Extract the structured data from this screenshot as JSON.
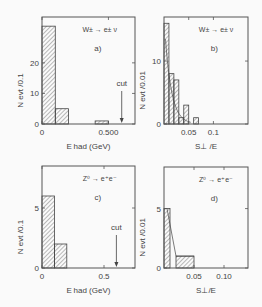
{
  "chart_data": [
    {
      "panel": "a",
      "type": "bar",
      "title": "W± → e± ν",
      "panel_label": "a)",
      "xlabel": "E_had (GeV)",
      "ylabel": "N_evt /0.1",
      "xlim": [
        0,
        0.7
      ],
      "ylim": [
        0,
        35
      ],
      "xticks": [
        "0",
        "0.500"
      ],
      "yticks": [
        "0",
        "10",
        "20"
      ],
      "bins": [
        [
          0.0,
          0.1
        ],
        [
          0.1,
          0.2
        ],
        [
          0.4,
          0.5
        ]
      ],
      "values": [
        32,
        5,
        1
      ],
      "annotation": {
        "text": "cut",
        "x": 0.6
      }
    },
    {
      "panel": "b",
      "type": "bar",
      "title": "W± → e± ν",
      "panel_label": "b)",
      "xlabel": "S⊥ /E",
      "ylabel": "N_evt /0.01",
      "xlim": [
        0,
        0.17
      ],
      "ylim": [
        0,
        17
      ],
      "xticks": [
        "0.05",
        "0.1"
      ],
      "yticks": [
        "0",
        "10"
      ],
      "bins": [
        [
          0.0,
          0.01
        ],
        [
          0.01,
          0.02
        ],
        [
          0.02,
          0.03
        ],
        [
          0.03,
          0.04
        ],
        [
          0.04,
          0.05
        ],
        [
          0.06,
          0.07
        ]
      ],
      "values": [
        16,
        8,
        7,
        1,
        3,
        1
      ],
      "curve": "exponential fit overlay"
    },
    {
      "panel": "c",
      "type": "bar",
      "title": "Z⁰ → e⁺e⁻",
      "panel_label": "c)",
      "xlabel": "E_had (GeV)",
      "ylabel": "N_evt /0.1",
      "xlim": [
        0,
        0.75
      ],
      "ylim": [
        0,
        8.5
      ],
      "xticks": [
        "0",
        "0.5"
      ],
      "yticks": [
        "0",
        "5"
      ],
      "bins": [
        [
          0.0,
          0.1
        ],
        [
          0.1,
          0.2
        ]
      ],
      "values": [
        6,
        2
      ],
      "annotation": {
        "text": "cut",
        "x": 0.6
      }
    },
    {
      "panel": "d",
      "type": "bar",
      "title": "Z⁰ → e⁺e⁻",
      "panel_label": "d)",
      "xlabel": "S⊥/E",
      "ylabel": "N_evt /0.01",
      "xlim": [
        0,
        0.14
      ],
      "ylim": [
        0,
        8.5
      ],
      "xticks": [
        "0.05",
        "0.10"
      ],
      "yticks": [
        "0",
        "5"
      ],
      "bins": [
        [
          0.0,
          0.01
        ],
        [
          0.02,
          0.05
        ]
      ],
      "values": [
        5,
        1
      ],
      "curve": "fit overlay"
    }
  ]
}
